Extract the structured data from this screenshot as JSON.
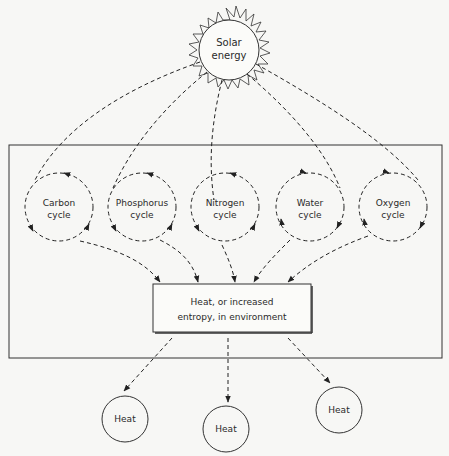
{
  "diagram": {
    "sun": {
      "label_line1": "Solar",
      "label_line2": "energy"
    },
    "cycles": [
      {
        "id": "carbon",
        "line1": "Carbon",
        "line2": "cycle"
      },
      {
        "id": "phosphorus",
        "line1": "Phosphorus",
        "line2": "cycle"
      },
      {
        "id": "nitrogen",
        "line1": "Nitrogen",
        "line2": "cycle"
      },
      {
        "id": "water",
        "line1": "Water",
        "line2": "cycle"
      },
      {
        "id": "oxygen",
        "line1": "Oxygen",
        "line2": "cycle"
      }
    ],
    "sink": {
      "line1": "Heat, or increased",
      "line2": "entropy, in environment"
    },
    "heat_outputs": [
      {
        "label": "Heat"
      },
      {
        "label": "Heat"
      },
      {
        "label": "Heat"
      }
    ],
    "colors": {
      "line": "#222222",
      "background": "#f7f7f5"
    }
  }
}
